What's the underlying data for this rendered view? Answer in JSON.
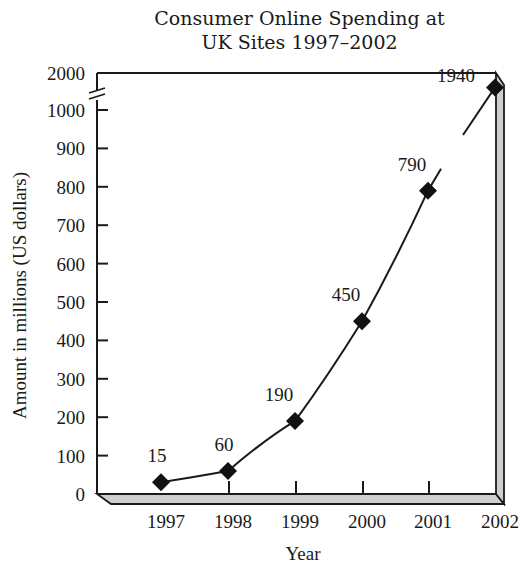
{
  "chart_data": {
    "type": "line",
    "title_lines": [
      "Consumer Online Spending at",
      "UK Sites 1997–2002"
    ],
    "xlabel": "Year",
    "ylabel": "Amount in millions (US dollars)",
    "categories": [
      "1997",
      "1998",
      "1999",
      "2000",
      "2001",
      "2002"
    ],
    "values": [
      15,
      60,
      190,
      450,
      790,
      1940
    ],
    "data_labels": [
      "15",
      "60",
      "190",
      "450",
      "790",
      "1940"
    ],
    "y_ticks": [
      "0",
      "100",
      "200",
      "300",
      "400",
      "500",
      "600",
      "700",
      "800",
      "900",
      "1000",
      "2000"
    ],
    "y_axis_break": "between 1000 and 2000",
    "ylim": [
      0,
      2000
    ],
    "grid": false,
    "legend": null,
    "marker": "diamond",
    "style": "3D frame with grey floor and right wall"
  }
}
